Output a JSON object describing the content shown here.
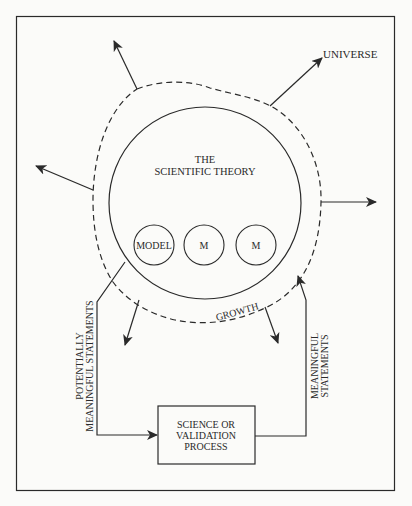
{
  "colors": {
    "background": "#fbfbf9",
    "stroke": "#2a2a2a",
    "text": "#2a2a2a"
  },
  "labels": {
    "universe": "UNIVERSE",
    "theory_line1": "THE",
    "theory_line2": "SCIENTIFIC THEORY",
    "model": "MODEL",
    "m1": "M",
    "m2": "M",
    "growth": "GROWTH",
    "left_flow_line1": "POTENTIALLY",
    "left_flow_line2": "MEANINGFUL STATEMENTS",
    "right_flow_line1": "MEANINGFUL",
    "right_flow_line2": "STATEMENTS",
    "process_line1": "SCIENCE OR",
    "process_line2": "VALIDATION",
    "process_line3": "PROCESS"
  }
}
